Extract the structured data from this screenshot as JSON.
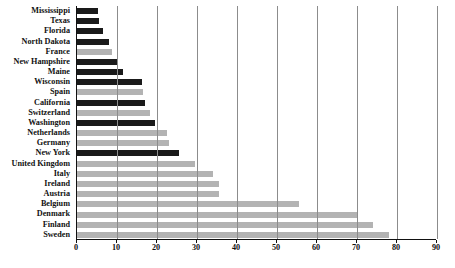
{
  "chart_data": {
    "type": "bar",
    "orientation": "horizontal",
    "title": "",
    "subtitle": "",
    "xlabel": "",
    "ylabel": "",
    "xlim": [
      0,
      90
    ],
    "ylim": null,
    "xticks": [
      0,
      10,
      20,
      30,
      40,
      50,
      60,
      70,
      80,
      90
    ],
    "grid": "vertical",
    "legend": null,
    "colors": {
      "dark": "#1a1a1a",
      "light": "#b3b3b3",
      "axis": "#111111",
      "gridline": "#8c8c8c",
      "background": "#ffffff"
    },
    "categories": [
      "Mississippi",
      "Texas",
      "Florida",
      "North Dakota",
      "France",
      "New Hampshire",
      "Maine",
      "Wisconsin",
      "Spain",
      "California",
      "Switzerland",
      "Washington",
      "Netherlands",
      "Germany",
      "New York",
      "United Kingdom",
      "Italy",
      "Ireland",
      "Austria",
      "Belgium",
      "Denmark",
      "Finland",
      "Sweden"
    ],
    "values": [
      5.2,
      5.5,
      6.5,
      8.0,
      8.7,
      10.3,
      11.5,
      16.3,
      16.5,
      17.0,
      18.2,
      19.5,
      22.5,
      23.0,
      25.5,
      29.5,
      34.0,
      35.5,
      35.5,
      55.5,
      70.0,
      74.0,
      78.0
    ],
    "series_group": [
      "dark",
      "dark",
      "dark",
      "dark",
      "light",
      "dark",
      "dark",
      "dark",
      "light",
      "dark",
      "light",
      "dark",
      "light",
      "light",
      "dark",
      "light",
      "light",
      "light",
      "light",
      "light",
      "light",
      "light",
      "light"
    ]
  }
}
